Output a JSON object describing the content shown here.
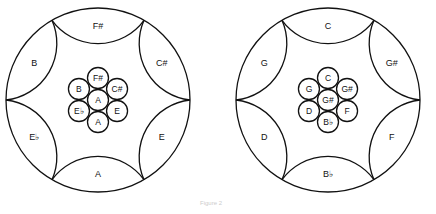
{
  "figure": {
    "caption": "Figure 2",
    "pans": [
      {
        "name": "left-pan",
        "outer_notes": [
          "F#",
          "C#",
          "E",
          "A",
          "E♭",
          "B"
        ],
        "inner_center": "A",
        "inner_ring": [
          "F#",
          "C#",
          "E",
          "A",
          "E♭",
          "B"
        ]
      },
      {
        "name": "right-pan",
        "outer_notes": [
          "C",
          "G#",
          "F",
          "B♭",
          "D",
          "G"
        ],
        "inner_center": "G#",
        "inner_ring": [
          "C",
          "G#",
          "F",
          "B♭",
          "D",
          "G"
        ]
      }
    ]
  }
}
